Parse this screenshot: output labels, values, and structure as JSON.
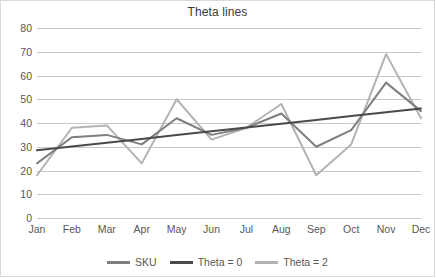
{
  "chart_data": {
    "type": "line",
    "title": "Theta lines",
    "xlabel": "",
    "ylabel": "",
    "categories": [
      "Jan",
      "Feb",
      "Mar",
      "Apr",
      "May",
      "Jun",
      "Jul",
      "Aug",
      "Sep",
      "Oct",
      "Nov",
      "Dec"
    ],
    "ylim": [
      0,
      80
    ],
    "yticks": [
      0,
      10,
      20,
      30,
      40,
      50,
      60,
      70,
      80
    ],
    "ytick_labels": [
      "0",
      "10",
      "20",
      "30",
      "40",
      "50",
      "60",
      "70",
      "80"
    ],
    "grid": true,
    "legend_position": "bottom",
    "series": [
      {
        "name": "SKU",
        "color": "#7f7f7f",
        "values": [
          23,
          34,
          35,
          31,
          42,
          35,
          38,
          44,
          30,
          37,
          57,
          45
        ]
      },
      {
        "name": "Theta = 0",
        "color": "#4a4a4a",
        "values": [
          28.5,
          30.1,
          31.7,
          33.3,
          34.9,
          36.5,
          38.1,
          39.7,
          41.3,
          42.9,
          44.5,
          46.1
        ]
      },
      {
        "name": "Theta = 2",
        "color": "#b3b3b3",
        "values": [
          18,
          38,
          39,
          23,
          50,
          33,
          38,
          48,
          18,
          31,
          69,
          42
        ]
      }
    ]
  },
  "legend": {
    "items": [
      {
        "label": "SKU",
        "color": "#7f7f7f"
      },
      {
        "label": "Theta = 0",
        "color": "#4a4a4a"
      },
      {
        "label": "Theta = 2",
        "color": "#b3b3b3"
      }
    ]
  },
  "colors": {
    "sku": "#7f7f7f",
    "theta0": "#4a4a4a",
    "theta2": "#b3b3b3",
    "gridline": "#c9c9c9",
    "border": "#d9d9d9",
    "text": "#585858"
  }
}
